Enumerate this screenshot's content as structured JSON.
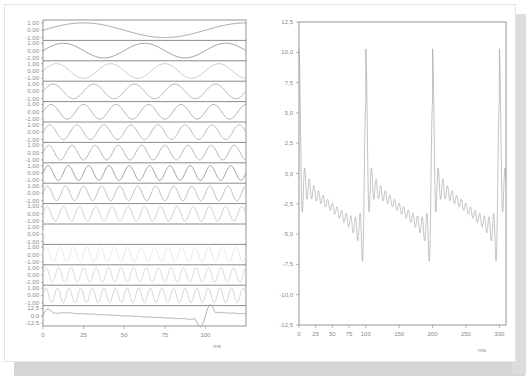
{
  "chart_data": [
    {
      "type": "line",
      "title": "",
      "description": "Stacked strips of harmonic sine components (1st through 14th harmonics) with their sum at the bottom",
      "xlabel": "ms",
      "ylabel": "",
      "xlim": [
        0,
        125
      ],
      "x_ticks": [
        "0",
        "25",
        "50",
        "75",
        "100"
      ],
      "strip_y_ticks": [
        "1.00",
        "0.00",
        "-1.00"
      ],
      "sum_y_ticks": [
        "12.5",
        "0.0",
        "-12.5"
      ],
      "series": [
        {
          "name": "harmonic 1",
          "cycles_per_100ms": 1,
          "amplitude": 1.0,
          "color": "#8c8c8c",
          "labels_visible": true
        },
        {
          "name": "harmonic 2",
          "cycles_per_100ms": 2,
          "amplitude": 1.0,
          "color": "#7f7f7f",
          "labels_visible": true
        },
        {
          "name": "harmonic 3",
          "cycles_per_100ms": 3,
          "amplitude": 1.0,
          "color": "#bdbdbd",
          "labels_visible": true
        },
        {
          "name": "harmonic 4",
          "cycles_per_100ms": 4,
          "amplitude": 1.0,
          "color": "#a0a0a0",
          "labels_visible": true
        },
        {
          "name": "harmonic 5",
          "cycles_per_100ms": 5,
          "amplitude": 1.0,
          "color": "#9a9a9a",
          "labels_visible": true
        },
        {
          "name": "harmonic 6",
          "cycles_per_100ms": 6,
          "amplitude": 1.0,
          "color": "#a8a8a8",
          "labels_visible": true
        },
        {
          "name": "harmonic 7",
          "cycles_per_100ms": 7,
          "amplitude": 1.0,
          "color": "#a4a4a4",
          "labels_visible": true
        },
        {
          "name": "harmonic 8",
          "cycles_per_100ms": 8,
          "amplitude": 1.0,
          "color": "#8a8a8a",
          "labels_visible": true
        },
        {
          "name": "harmonic 9",
          "cycles_per_100ms": 9,
          "amplitude": 1.0,
          "color": "#b0b0b0",
          "labels_visible": true
        },
        {
          "name": "harmonic 10",
          "cycles_per_100ms": 10,
          "amplitude": 1.0,
          "color": "#c4c4c4",
          "labels_visible": true
        },
        {
          "name": "harmonic 11",
          "cycles_per_100ms": 11,
          "amplitude": 1.0,
          "color": "#ffffff",
          "labels_visible": false
        },
        {
          "name": "harmonic 12",
          "cycles_per_100ms": 12,
          "amplitude": 1.0,
          "color": "#e2e2e2",
          "labels_visible": false
        },
        {
          "name": "harmonic 13",
          "cycles_per_100ms": 13,
          "amplitude": 1.0,
          "color": "#d0d0d0",
          "labels_visible": false
        },
        {
          "name": "harmonic 14",
          "cycles_per_100ms": 14,
          "amplitude": 1.0,
          "color": "#cacaca",
          "labels_visible": false
        },
        {
          "name": "sum",
          "cycles_per_100ms": 1,
          "amplitude": 12.5,
          "color": "#9a9a9a",
          "labels_visible": true
        }
      ]
    },
    {
      "type": "line",
      "title": "",
      "description": "Sum of harmonics: sawtooth-like waveform with Gibbs ringing, period 100 ms",
      "xlabel": "ms",
      "ylabel": "",
      "xlim": [
        0,
        310
      ],
      "ylim": [
        -12.5,
        12.5
      ],
      "x_ticks": [
        "0",
        "25",
        "50",
        "75",
        "100",
        "150",
        "200",
        "250",
        "300"
      ],
      "y_ticks": [
        "12,5",
        "10,0",
        "7,5",
        "5,0",
        "2,5",
        "0,0",
        "-2,5",
        "-5,0",
        "-7,5",
        "-10,0",
        "-12,5"
      ],
      "grid": false,
      "period_ms": 100,
      "peaks": [
        {
          "x": 0,
          "y": 10.4
        },
        {
          "x": 100,
          "y": 10.4
        },
        {
          "x": 200,
          "y": 10.4
        },
        {
          "x": 300,
          "y": 10.4
        }
      ],
      "troughs": [
        {
          "x": 97,
          "y": -10.5
        },
        {
          "x": 197,
          "y": -10.5
        },
        {
          "x": 297,
          "y": -10.5
        }
      ],
      "series": [
        {
          "name": "sum",
          "color": "#9a9a9a"
        }
      ]
    }
  ],
  "left": {
    "xlabel": "ms",
    "x_ticks": [
      "0",
      "25",
      "50",
      "75",
      "100"
    ],
    "strip_ticks": [
      "1.00",
      "0.00",
      "-1.00"
    ],
    "sum_ticks": [
      "12.5",
      "0.0",
      "-12.5"
    ]
  },
  "right": {
    "xlabel": "ms",
    "x_ticks": [
      "0",
      "25",
      "50",
      "75",
      "100",
      "150",
      "200",
      "250",
      "300"
    ],
    "y_ticks": [
      "12,5",
      "10,0",
      "7,5",
      "5,0",
      "2,5",
      "0,0",
      "-2,5",
      "-5,0",
      "-7,5",
      "-10,0",
      "-12,5"
    ]
  }
}
